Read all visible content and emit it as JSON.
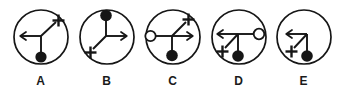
{
  "figure": {
    "type": "abstract-symbol-multiple-choice",
    "background_color": "#ffffff",
    "stroke_color": "#161616",
    "fill_color": "#161616",
    "open_fill_color": "#ffffff",
    "count": 5,
    "options": [
      {
        "label": "A",
        "name": "option-a",
        "description": "Circle containing a three-branch junction: arrow pointing left, diagonal up-right ending in a plus sign, and a short stem down ending in a filled black dot.",
        "elements": [
          {
            "kind": "arrow",
            "direction": "left"
          },
          {
            "kind": "plus",
            "direction": "up-right"
          },
          {
            "kind": "filled-dot",
            "direction": "down"
          }
        ]
      },
      {
        "label": "B",
        "name": "option-b",
        "description": "Circle containing a three-branch junction: stem up ending in a filled black dot, arrow pointing right, and a diagonal down-left ending in a plus sign.",
        "elements": [
          {
            "kind": "filled-dot",
            "direction": "up"
          },
          {
            "kind": "arrow",
            "direction": "right"
          },
          {
            "kind": "plus",
            "direction": "down-left"
          }
        ]
      },
      {
        "label": "C",
        "name": "option-c",
        "description": "Circle containing a four-branch junction: line left ending in an open circle, diagonal up-right ending in a plus sign, arrow pointing right, and a stem down ending in a filled black dot.",
        "elements": [
          {
            "kind": "open-circle",
            "direction": "left"
          },
          {
            "kind": "plus",
            "direction": "up-right"
          },
          {
            "kind": "arrow",
            "direction": "right"
          },
          {
            "kind": "filled-dot",
            "direction": "down"
          }
        ]
      },
      {
        "label": "D",
        "name": "option-d",
        "description": "Circle containing a four-branch junction: arrow pointing left, line right ending in an open circle, diagonal down-left ending in a plus sign, and a stem down ending in a filled black dot.",
        "elements": [
          {
            "kind": "arrow",
            "direction": "left"
          },
          {
            "kind": "open-circle",
            "direction": "right"
          },
          {
            "kind": "plus",
            "direction": "down-left"
          },
          {
            "kind": "filled-dot",
            "direction": "down"
          }
        ]
      },
      {
        "label": "E",
        "name": "option-e",
        "description": "Circle containing a three-branch junction: arrow pointing left, diagonal down-left ending in a plus sign, and a stem down ending in a filled black dot.",
        "elements": [
          {
            "kind": "arrow",
            "direction": "left"
          },
          {
            "kind": "plus",
            "direction": "down-left"
          },
          {
            "kind": "filled-dot",
            "direction": "down"
          }
        ]
      }
    ]
  }
}
